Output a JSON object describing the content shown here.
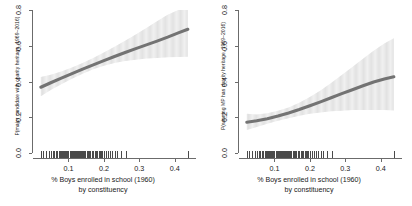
{
  "chart_data": [
    {
      "type": "line",
      "panel": "left",
      "title": "",
      "xlabel": "% Boys enrolled in school (1960)",
      "xlabel_line2": "by constituency",
      "ylabel": "P(major candidate with charity heritage, 1969–2016)",
      "xlim": [
        0.0,
        0.46
      ],
      "ylim": [
        0.0,
        0.8
      ],
      "xticks": [
        0.1,
        0.2,
        0.3,
        0.4
      ],
      "xtick_labels": [
        "0.1",
        "0.2",
        "0.3",
        "0.4"
      ],
      "yticks": [
        0.0,
        0.2,
        0.4,
        0.6,
        0.8
      ],
      "ytick_labels": [
        "0.0",
        "0.2",
        "0.4",
        "0.6",
        "0.8"
      ],
      "grid": false,
      "legend": "none",
      "x": [
        0.022,
        0.05,
        0.08,
        0.11,
        0.14,
        0.17,
        0.2,
        0.23,
        0.26,
        0.29,
        0.32,
        0.35,
        0.38,
        0.41,
        0.437
      ],
      "fit": [
        0.368,
        0.393,
        0.419,
        0.444,
        0.469,
        0.493,
        0.517,
        0.54,
        0.562,
        0.584,
        0.605,
        0.626,
        0.648,
        0.672,
        0.692
      ],
      "ci_lower": [
        0.318,
        0.352,
        0.385,
        0.416,
        0.444,
        0.468,
        0.488,
        0.503,
        0.514,
        0.522,
        0.528,
        0.532,
        0.535,
        0.537,
        0.538
      ],
      "ci_upper": [
        0.425,
        0.438,
        0.456,
        0.478,
        0.503,
        0.531,
        0.562,
        0.594,
        0.628,
        0.663,
        0.7,
        0.737,
        0.774,
        0.8,
        0.8
      ],
      "line_color": "#737373",
      "band_color": "#d0d0d0",
      "rug_x": [
        0.022,
        0.027,
        0.038,
        0.046,
        0.052,
        0.056,
        0.06,
        0.065,
        0.068,
        0.072,
        0.076,
        0.079,
        0.082,
        0.085,
        0.088,
        0.091,
        0.094,
        0.097,
        0.1,
        0.103,
        0.106,
        0.109,
        0.112,
        0.115,
        0.118,
        0.121,
        0.124,
        0.127,
        0.13,
        0.133,
        0.136,
        0.139,
        0.142,
        0.145,
        0.148,
        0.151,
        0.154,
        0.158,
        0.162,
        0.166,
        0.17,
        0.174,
        0.178,
        0.182,
        0.185,
        0.187,
        0.189,
        0.191,
        0.196,
        0.201,
        0.206,
        0.212,
        0.218,
        0.224,
        0.231,
        0.238,
        0.247,
        0.262,
        0.437
      ]
    },
    {
      "type": "line",
      "panel": "right",
      "title": "",
      "xlabel": "% Boys enrolled in school (1960)",
      "xlabel_line2": "by constituency",
      "ylabel": "P(winning MP has charity heritage, 1969–2016)",
      "xlim": [
        0.0,
        0.46
      ],
      "ylim": [
        0.0,
        0.8
      ],
      "xticks": [
        0.1,
        0.2,
        0.3,
        0.4
      ],
      "xtick_labels": [
        "0.1",
        "0.2",
        "0.3",
        "0.4"
      ],
      "yticks": [
        0.0,
        0.2,
        0.4,
        0.6,
        0.8
      ],
      "ytick_labels": [
        "0.0",
        "0.2",
        "0.4",
        "0.6",
        "0.8"
      ],
      "grid": false,
      "legend": "none",
      "x": [
        0.022,
        0.05,
        0.08,
        0.11,
        0.14,
        0.17,
        0.2,
        0.23,
        0.26,
        0.29,
        0.32,
        0.35,
        0.38,
        0.41,
        0.437
      ],
      "fit": [
        0.172,
        0.18,
        0.192,
        0.207,
        0.224,
        0.243,
        0.264,
        0.286,
        0.309,
        0.332,
        0.354,
        0.376,
        0.397,
        0.414,
        0.426
      ],
      "ci_lower": [
        0.128,
        0.146,
        0.163,
        0.18,
        0.195,
        0.208,
        0.219,
        0.227,
        0.233,
        0.237,
        0.24,
        0.241,
        0.241,
        0.24,
        0.238
      ],
      "ci_upper": [
        0.219,
        0.216,
        0.222,
        0.236,
        0.255,
        0.281,
        0.313,
        0.35,
        0.392,
        0.436,
        0.481,
        0.527,
        0.572,
        0.612,
        0.642
      ],
      "line_color": "#737373",
      "band_color": "#d0d0d0",
      "rug_x": [
        0.022,
        0.027,
        0.038,
        0.046,
        0.052,
        0.056,
        0.06,
        0.065,
        0.068,
        0.072,
        0.076,
        0.079,
        0.082,
        0.085,
        0.088,
        0.091,
        0.094,
        0.097,
        0.1,
        0.103,
        0.106,
        0.109,
        0.112,
        0.115,
        0.118,
        0.121,
        0.124,
        0.127,
        0.13,
        0.133,
        0.136,
        0.139,
        0.142,
        0.145,
        0.148,
        0.151,
        0.154,
        0.158,
        0.162,
        0.166,
        0.17,
        0.174,
        0.178,
        0.182,
        0.185,
        0.187,
        0.189,
        0.191,
        0.196,
        0.201,
        0.206,
        0.212,
        0.218,
        0.224,
        0.231,
        0.238,
        0.247,
        0.262,
        0.437
      ]
    }
  ]
}
